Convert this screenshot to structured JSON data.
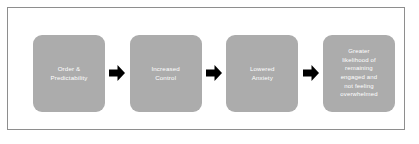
{
  "diagram": {
    "type": "linear-flow-chart",
    "orientation": "left-to-right",
    "frame": {
      "border_color": "#8e8e8e",
      "background_color": "#ffffff"
    },
    "box_style": {
      "fill_color": "#acacac",
      "text_color": "#ffffff",
      "shape": "rounded-rectangle"
    },
    "connector": {
      "icon": "right-arrow-icon",
      "color": "#000000",
      "count": 3
    },
    "steps": [
      {
        "label": "Order &\nPredictability"
      },
      {
        "label": "Increased\nControl"
      },
      {
        "label": "Lowered\nAnxiety"
      },
      {
        "label": "Greater\nlikelihood of\nremaining\nengaged and\nnot feeling\noverwhelmed"
      }
    ]
  }
}
